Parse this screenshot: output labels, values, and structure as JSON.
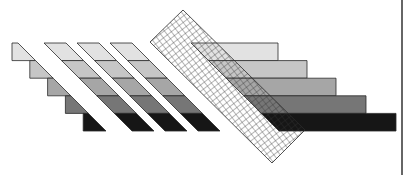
{
  "figure": {
    "shades": [
      "#e2e2e2",
      "#c6c6c6",
      "#a6a6a6",
      "#767676",
      "#161616"
    ],
    "stroke_color": "#2a2a2a",
    "hatch_color": "#333333",
    "groups": [
      {
        "name": "staircase",
        "levels": 5
      },
      {
        "name": "diagonal-stripe",
        "count": 3,
        "levels": 5
      },
      {
        "name": "crosshatch-band",
        "pattern": "grid"
      },
      {
        "name": "horizontal-bars",
        "levels": 5
      }
    ]
  }
}
